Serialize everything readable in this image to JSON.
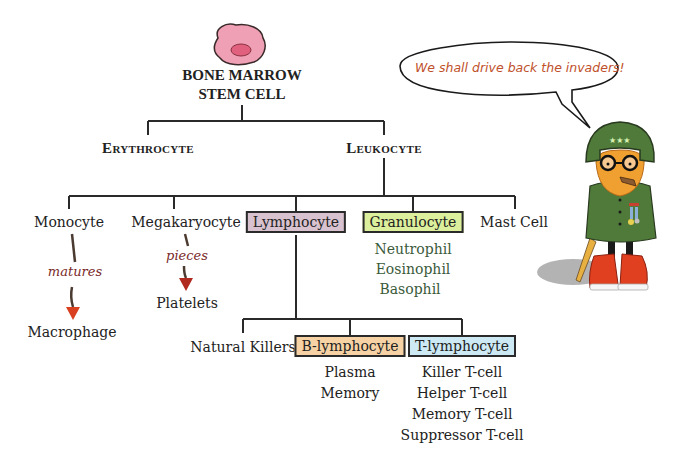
{
  "root": {
    "title_line1": "BONE MARROW",
    "title_line2": "STEM CELL",
    "cell_colors": {
      "body": "#f0a0b4",
      "nucleus": "#e0607e",
      "outline": "#3a2a2a"
    }
  },
  "level1": {
    "erythrocyte": "Erythrocyte",
    "leukocyte": "Leukocyte"
  },
  "level2": {
    "monocyte": "Monocyte",
    "megakaryocyte": "Megakaryocyte",
    "lymphocyte": "Lymphocyte",
    "granulocyte": "Granulocyte",
    "mast_cell": "Mast Cell"
  },
  "monocyte_branch": {
    "verb": "matures",
    "result": "Macrophage"
  },
  "megakaryocyte_branch": {
    "verb": "pieces",
    "result": "Platelets"
  },
  "granulocyte_types": [
    "Neutrophil",
    "Eosinophil",
    "Basophil"
  ],
  "lymphocyte_children": {
    "natural_killers": "Natural Killers",
    "b_lymphocyte": "B-lymphocyte",
    "t_lymphocyte": "T-lymphocyte"
  },
  "b_types": [
    "Plasma",
    "Memory"
  ],
  "t_types": [
    "Killer T-cell",
    "Helper T-cell",
    "Memory T-cell",
    "Suppressor T-cell"
  ],
  "box_colors": {
    "lymphocyte": "#d8c2cf",
    "granulocyte": "#dcef9c",
    "b_lymphocyte": "#f7d2a4",
    "t_lymphocyte": "#cdeaf4"
  },
  "speech_bubble": {
    "text": "We shall drive back the invaders!"
  },
  "character": {
    "description": "cartoon general with helmet, glasses, beard, cigar and red sneakers",
    "colors": {
      "helmet": "#4f7a3a",
      "beard": "#f0a030",
      "shoes": "#e04020"
    }
  }
}
